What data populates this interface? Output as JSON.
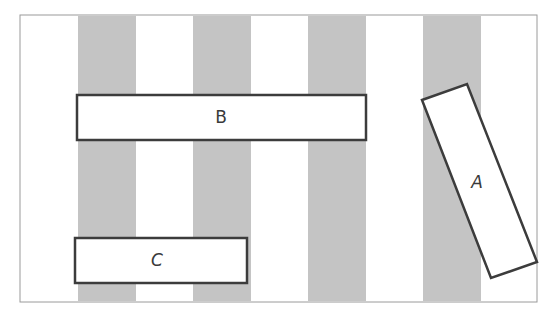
{
  "diagram": {
    "stripes": {
      "count": 4,
      "color": "#c4c4c4"
    },
    "frame_color": "#9a9a9a",
    "box_stroke": "#3c3c3c",
    "boxes": [
      {
        "id": "A",
        "label": "A",
        "orientation": "tilted"
      },
      {
        "id": "B",
        "label": "B",
        "orientation": "horizontal"
      },
      {
        "id": "C",
        "label": "C",
        "orientation": "horizontal"
      }
    ]
  }
}
